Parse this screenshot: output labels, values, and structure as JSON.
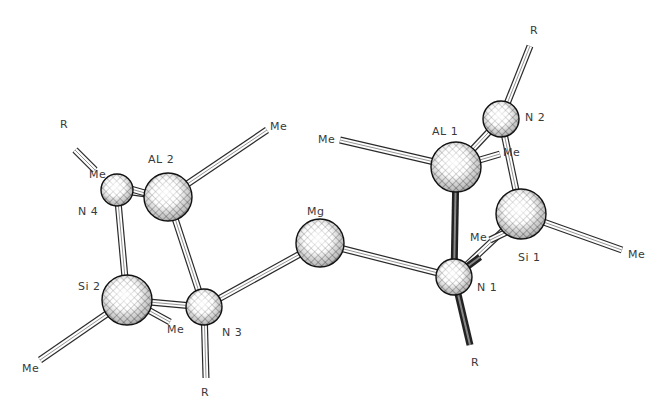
{
  "diagram": {
    "type": "ball-and-stick molecular structure",
    "colors": {
      "ink": "#2a2a2a",
      "background": "#ffffff",
      "label": "#3a3a3a"
    },
    "atoms": [
      {
        "id": "Al2",
        "label": "AL 2",
        "x": 168,
        "y": 197,
        "r": 24,
        "lx": 148,
        "ly": 163
      },
      {
        "id": "N4",
        "label": "N 4",
        "x": 117,
        "y": 190,
        "r": 16,
        "lx": 78,
        "ly": 215
      },
      {
        "id": "Si2",
        "label": "Si 2",
        "x": 127,
        "y": 300,
        "r": 25,
        "lx": 78,
        "ly": 290
      },
      {
        "id": "N3",
        "label": "N 3",
        "x": 204,
        "y": 307,
        "r": 18,
        "lx": 222,
        "ly": 336
      },
      {
        "id": "Mg",
        "label": "Mg",
        "x": 320,
        "y": 243,
        "r": 24,
        "lx": 307,
        "ly": 215
      },
      {
        "id": "N1",
        "label": "N 1",
        "x": 454,
        "y": 277,
        "r": 18,
        "lx": 477,
        "ly": 291
      },
      {
        "id": "Al1",
        "label": "AL 1",
        "x": 456,
        "y": 167,
        "r": 25,
        "lx": 432,
        "ly": 135
      },
      {
        "id": "N2",
        "label": "N 2",
        "x": 501,
        "y": 119,
        "r": 18,
        "lx": 525,
        "ly": 121
      },
      {
        "id": "Si1",
        "label": "Si 1",
        "x": 521,
        "y": 214,
        "r": 25,
        "lx": 518,
        "ly": 261
      }
    ],
    "substituents": [
      {
        "label": "R",
        "x": 60,
        "y": 128
      },
      {
        "label": "Me",
        "x": 89,
        "y": 178
      },
      {
        "label": "Me",
        "x": 270,
        "y": 130
      },
      {
        "label": "Me",
        "x": 22,
        "y": 372
      },
      {
        "label": "Me",
        "x": 167,
        "y": 333
      },
      {
        "label": "R",
        "x": 201,
        "y": 396
      },
      {
        "label": "Me",
        "x": 318,
        "y": 143
      },
      {
        "label": "R",
        "x": 530,
        "y": 34
      },
      {
        "label": "Me",
        "x": 503,
        "y": 156
      },
      {
        "label": "Me",
        "x": 470,
        "y": 241
      },
      {
        "label": "Me",
        "x": 628,
        "y": 258
      },
      {
        "label": "R",
        "x": 471,
        "y": 366
      }
    ],
    "bonds": [
      {
        "from": [
          117,
          190
        ],
        "to": [
          168,
          197
        ],
        "style": "normal"
      },
      {
        "from": [
          117,
          190
        ],
        "to": [
          127,
          300
        ],
        "style": "normal"
      },
      {
        "from": [
          168,
          197
        ],
        "to": [
          204,
          307
        ],
        "style": "normal"
      },
      {
        "from": [
          127,
          300
        ],
        "to": [
          204,
          307
        ],
        "style": "normal"
      },
      {
        "from": [
          204,
          307
        ],
        "to": [
          320,
          243
        ],
        "style": "normal"
      },
      {
        "from": [
          320,
          243
        ],
        "to": [
          454,
          277
        ],
        "style": "normal"
      },
      {
        "from": [
          454,
          277
        ],
        "to": [
          456,
          167
        ],
        "style": "dark"
      },
      {
        "from": [
          456,
          167
        ],
        "to": [
          501,
          119
        ],
        "style": "normal"
      },
      {
        "from": [
          501,
          119
        ],
        "to": [
          521,
          214
        ],
        "style": "normal"
      },
      {
        "from": [
          521,
          214
        ],
        "to": [
          454,
          277
        ],
        "style": "normal"
      },
      {
        "from": [
          168,
          197
        ],
        "to": [
          267,
          130
        ],
        "style": "normal"
      },
      {
        "from": [
          75,
          150
        ],
        "to": [
          95,
          170
        ],
        "style": "normal"
      },
      {
        "from": [
          110,
          183
        ],
        "to": [
          152,
          195
        ],
        "style": "normal"
      },
      {
        "from": [
          127,
          300
        ],
        "to": [
          40,
          360
        ],
        "style": "normal"
      },
      {
        "from": [
          130,
          300
        ],
        "to": [
          170,
          322
        ],
        "style": "normal"
      },
      {
        "from": [
          204,
          307
        ],
        "to": [
          206,
          378
        ],
        "style": "normal"
      },
      {
        "from": [
          340,
          140
        ],
        "to": [
          456,
          167
        ],
        "style": "normal"
      },
      {
        "from": [
          501,
          119
        ],
        "to": [
          530,
          46
        ],
        "style": "normal"
      },
      {
        "from": [
          456,
          167
        ],
        "to": [
          500,
          154
        ],
        "style": "normal"
      },
      {
        "from": [
          521,
          214
        ],
        "to": [
          622,
          250
        ],
        "style": "normal"
      },
      {
        "from": [
          490,
          240
        ],
        "to": [
          521,
          225
        ],
        "style": "normal"
      },
      {
        "from": [
          454,
          277
        ],
        "to": [
          470,
          345
        ],
        "style": "dark"
      },
      {
        "from": [
          460,
          272
        ],
        "to": [
          480,
          257
        ],
        "style": "dark"
      }
    ]
  }
}
